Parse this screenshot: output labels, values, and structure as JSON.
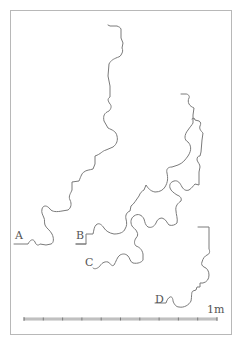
{
  "figure": {
    "type": "architectural molding profiles",
    "profiles": [
      {
        "id": "A",
        "label": "A"
      },
      {
        "id": "B",
        "label": "B"
      },
      {
        "id": "C",
        "label": "C"
      },
      {
        "id": "D",
        "label": "D"
      }
    ],
    "scale_bar": {
      "label": "1m",
      "divisions": 10
    },
    "colors": {
      "line": "#7a7a7a",
      "frame": "#b8b8b8",
      "text": "#555555",
      "background": "#ffffff"
    }
  }
}
